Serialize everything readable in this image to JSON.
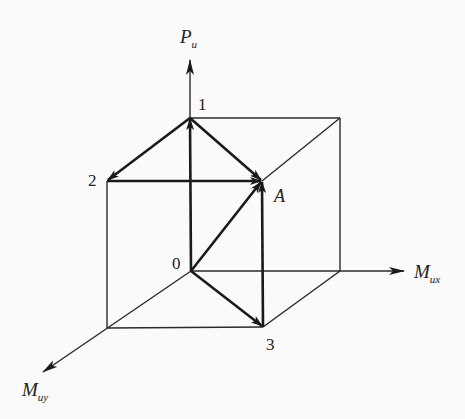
{
  "figure": {
    "type": "3d-vector-cube-diagram",
    "colors": {
      "background": "#fafafa",
      "line": "#1a1a1a"
    },
    "axes": {
      "vertical": {
        "main": "P",
        "sub": "и"
      },
      "x": {
        "main": "M",
        "sub": "их"
      },
      "y": {
        "main": "M",
        "sub": "иy"
      }
    },
    "points": {
      "origin": "0",
      "p1": "1",
      "p2": "2",
      "p3": "3",
      "target": "A"
    },
    "vectors": [
      {
        "from": "0",
        "to": "1"
      },
      {
        "from": "1",
        "to": "2"
      },
      {
        "from": "1",
        "to": "A"
      },
      {
        "from": "2",
        "to": "A"
      },
      {
        "from": "0",
        "to": "A"
      },
      {
        "from": "0",
        "to": "3"
      },
      {
        "from": "3",
        "to": "A"
      }
    ]
  }
}
